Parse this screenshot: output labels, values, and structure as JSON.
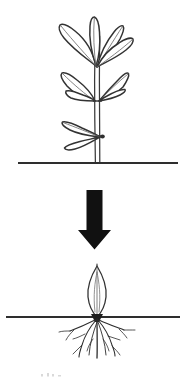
{
  "figure": {
    "background_color": "#ffffff",
    "ink_color": "#2b2b2b",
    "outline_color": "#333333",
    "vein_color": "#6e6e6e",
    "arrow_color": "#111111",
    "ground_color": "#2e2e2e",
    "width": 186,
    "height": 379
  },
  "panels": {
    "top": {
      "name": "parent-plant-panel",
      "label": "Parent plant with leaves above soil",
      "ground_line": {
        "label": "soil-surface-line",
        "x1": 18,
        "x2": 178,
        "y": 163
      },
      "stem": {
        "label": "main-stem",
        "top_y": 32,
        "base_y": 163,
        "center_x": 97
      },
      "leaf_clusters": [
        {
          "name": "top-leaf-cluster",
          "leaf_count": 4,
          "y_range": [
            18,
            68
          ]
        },
        {
          "name": "middle-leaf-pair",
          "leaf_count": 2,
          "y_range": [
            66,
            104
          ]
        },
        {
          "name": "lower-left-leaf",
          "leaf_count": 1,
          "y_range": [
            122,
            150
          ]
        }
      ],
      "detached_leaf": {
        "name": "detached-leaf",
        "label": "Removed leaf cutting",
        "x_range": [
          121,
          161
        ],
        "y_range": [
          113,
          141
        ]
      }
    },
    "arrow": {
      "name": "process-arrow",
      "label": "Downward process arrow",
      "direction": "down",
      "x_center": 94,
      "top_y": 190,
      "bottom_y": 249,
      "shaft_width": 15,
      "head_width": 33
    },
    "bottom": {
      "name": "rooted-cutting-panel",
      "label": "Rooted leaf cutting in soil",
      "ground_line": {
        "label": "soil-surface-line",
        "x1": 6,
        "x2": 180,
        "y": 317
      },
      "cutting": {
        "name": "leaf-cutting",
        "label": "Planted leaf cutting with new roots",
        "leaf_top_y": 264,
        "leaf_bottom_y": 317,
        "center_x": 97
      },
      "roots": {
        "name": "root-system",
        "label": "Developing root system",
        "origin_x": 97,
        "origin_y": 318,
        "depth_y": 360,
        "branch_count": 9
      }
    }
  },
  "caption": {
    "visible_text": ""
  }
}
